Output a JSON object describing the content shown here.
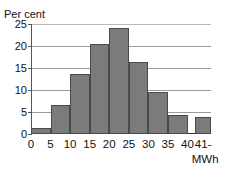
{
  "title": {
    "text": "Of detached houses in 1995",
    "visible_fragment": "clipped at top edge"
  },
  "axes": {
    "y_unit_label": "Per cent",
    "x_unit_label": "MWh",
    "y_ticks": [
      {
        "value": 25,
        "label": "25"
      },
      {
        "value": 20,
        "label": "20"
      },
      {
        "value": 15,
        "label": "15"
      },
      {
        "value": 10,
        "label": "10"
      },
      {
        "value": 5,
        "label": "5"
      },
      {
        "value": 0,
        "label": "0"
      }
    ],
    "x_ticks": [
      {
        "value": 0,
        "label": "0"
      },
      {
        "value": 5,
        "label": "5"
      },
      {
        "value": 10,
        "label": "10"
      },
      {
        "value": 15,
        "label": "15"
      },
      {
        "value": 20,
        "label": "20"
      },
      {
        "value": 25,
        "label": "25"
      },
      {
        "value": 30,
        "label": "30"
      },
      {
        "value": 35,
        "label": "35"
      },
      {
        "value": 40,
        "label": "40"
      },
      {
        "value": 44,
        "label": "41-"
      }
    ]
  },
  "colors": {
    "bar_fill": "#7b7b7b",
    "bar_stroke": "#4a4a4a",
    "gridline": "#9a9a9a",
    "axis": "#333333",
    "background": "#ffffff",
    "text": "#111111"
  },
  "chart_data": {
    "type": "bar",
    "title": "Of detached houses in 1995",
    "xlabel": "MWh",
    "ylabel": "Per cent",
    "ylim": [
      0,
      25
    ],
    "xlim": [
      0,
      46
    ],
    "grid": true,
    "legend": null,
    "categories": [
      "0-5",
      "5-10",
      "10-15",
      "15-20",
      "20-25",
      "25-30",
      "30-35",
      "35-40",
      "41-"
    ],
    "values": [
      1.4,
      6.6,
      13.7,
      20.4,
      24.1,
      16.4,
      9.6,
      4.4,
      3.8
    ],
    "bins": [
      {
        "label": "0-5",
        "x0": 0,
        "x1": 5,
        "value": 1.4
      },
      {
        "label": "5-10",
        "x0": 5,
        "x1": 10,
        "value": 6.6
      },
      {
        "label": "10-15",
        "x0": 10,
        "x1": 15,
        "value": 13.7
      },
      {
        "label": "15-20",
        "x0": 15,
        "x1": 20,
        "value": 20.4
      },
      {
        "label": "20-25",
        "x0": 20,
        "x1": 25,
        "value": 24.1
      },
      {
        "label": "25-30",
        "x0": 25,
        "x1": 30,
        "value": 16.4
      },
      {
        "label": "30-35",
        "x0": 30,
        "x1": 35,
        "value": 9.6
      },
      {
        "label": "35-40",
        "x0": 35,
        "x1": 40,
        "value": 4.4
      },
      {
        "label": "41-",
        "x0": 42,
        "x1": 46,
        "value": 3.8
      }
    ]
  }
}
